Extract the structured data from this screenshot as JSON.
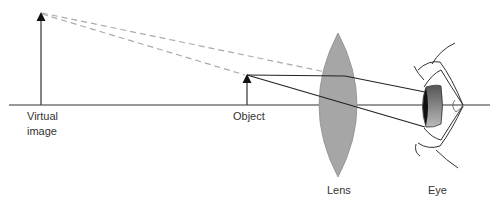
{
  "diagram": {
    "labels": {
      "virtual_image_line1": "Virtual",
      "virtual_image_line2": "image",
      "object": "Object",
      "lens": "Lens",
      "eye": "Eye"
    },
    "colors": {
      "background": "#ffffff",
      "axis": "#333333",
      "ray": "#222222",
      "dashed_ray": "#aaaaaa",
      "lens_fill": "#a6a6a6",
      "lens_stroke": "#8f8f8f",
      "iris_dark": "#1a1a1a",
      "iris_gray": "#777777",
      "text": "#333333"
    },
    "elements": {
      "optical_axis": {
        "x1": 9,
        "x2": 490,
        "y": 105
      },
      "virtual_image_arrow": {
        "x": 41,
        "top": 13,
        "base": 105
      },
      "object_arrow": {
        "x": 247,
        "top": 75,
        "base": 105
      },
      "lens": {
        "cx": 338,
        "top": 33,
        "bottom": 177,
        "left": 312,
        "right": 365
      },
      "eye": {
        "pupil_x": 425,
        "cornea_tip_x": 462
      }
    }
  }
}
